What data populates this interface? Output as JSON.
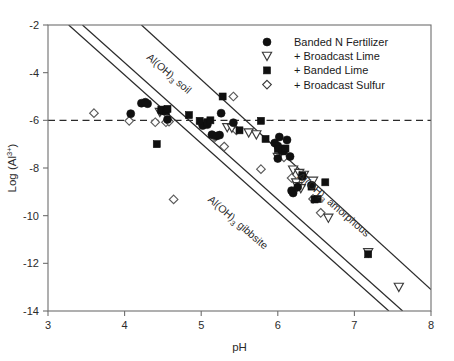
{
  "chart_data": {
    "type": "scatter",
    "title": "",
    "xlabel": "pH",
    "ylabel": "Log (Al3+)",
    "ylabel_base": "Log (Al",
    "ylabel_sup": "3+",
    "ylabel_tail": ")",
    "xlim": [
      3,
      8
    ],
    "ylim": [
      -14,
      -2
    ],
    "xticks": [
      3,
      4,
      5,
      6,
      7,
      8
    ],
    "xtick_labels": [
      "3",
      "4",
      "5",
      "6",
      "7",
      "8"
    ],
    "yticks": [
      -2,
      -4,
      -6,
      -8,
      -10,
      -12,
      -14
    ],
    "ytick_labels": [
      "-2",
      "-4",
      "-6",
      "-8",
      "-10",
      "-12",
      "-14"
    ],
    "grid": false,
    "legend_position": "top-right",
    "legend": [
      {
        "label": "Banded N Fertilizer",
        "marker": "filled-circle"
      },
      {
        "label": "+ Broadcast Lime",
        "marker": "open-triangle-down"
      },
      {
        "label": "+ Banded Lime",
        "marker": "filled-square"
      },
      {
        "label": "+ Broadcast Sulfur",
        "marker": "open-diamond"
      }
    ],
    "reference_line": {
      "label": "",
      "style": "dashed",
      "orientation": "horizontal",
      "y": -6.0
    },
    "annotations": [
      {
        "text": "Al(OH)3 soil",
        "base": "Al(OH)",
        "sub": "3",
        "tail": " soil",
        "x": 4.55,
        "y": -4.15,
        "rotation": 41
      },
      {
        "text": "Al(OH)3 gibbsite",
        "base": "Al(OH)",
        "sub": "3",
        "tail": " gibbsite",
        "x": 5.45,
        "y": -10.4,
        "rotation": 41
      },
      {
        "text": "Al(OH)3 amorphous",
        "base": "Al(OH)",
        "sub": "3",
        "tail": " amorphous",
        "x": 6.7,
        "y": -9.65,
        "rotation": 41
      }
    ],
    "solubility_lines": [
      {
        "name": "Al(OH)3 soil",
        "x1": 3.27,
        "y1": -2.0,
        "x2": 7.45,
        "y2": -14.0
      },
      {
        "name": "Al(OH)3 gibbsite",
        "x1": 3.45,
        "y1": -2.0,
        "x2": 7.63,
        "y2": -14.0
      },
      {
        "name": "Al(OH)3 amorphous",
        "x1": 4.22,
        "y1": -2.0,
        "x2": 8.0,
        "y2": -13.1
      }
    ],
    "series": [
      {
        "name": "Banded N Fertilizer",
        "marker": "filled-circle",
        "color": "#101010",
        "points": [
          [
            4.08,
            -5.72
          ],
          [
            4.22,
            -5.28
          ],
          [
            4.27,
            -5.24
          ],
          [
            4.3,
            -5.3
          ],
          [
            4.48,
            -5.6
          ],
          [
            4.52,
            -5.58
          ],
          [
            4.56,
            -5.96
          ],
          [
            5.02,
            -6.22
          ],
          [
            5.08,
            -6.18
          ],
          [
            5.14,
            -6.6
          ],
          [
            5.2,
            -6.66
          ],
          [
            5.24,
            -6.62
          ],
          [
            5.26,
            -5.7
          ],
          [
            5.42,
            -6.1
          ],
          [
            5.96,
            -6.95
          ],
          [
            6.0,
            -7.08
          ],
          [
            6.04,
            -7.22
          ],
          [
            6.08,
            -7.28
          ],
          [
            6.02,
            -6.7
          ],
          [
            6.12,
            -6.82
          ],
          [
            6.16,
            -7.52
          ],
          [
            6.0,
            -7.6
          ],
          [
            6.18,
            -8.95
          ],
          [
            6.2,
            -9.05
          ],
          [
            6.26,
            -8.8
          ],
          [
            6.32,
            -8.35
          ],
          [
            6.44,
            -8.72
          ]
        ]
      },
      {
        "name": "+ Broadcast Lime",
        "marker": "open-triangle-down",
        "color": "#3a3a3a",
        "points": [
          [
            4.46,
            -5.66
          ],
          [
            5.34,
            -6.3
          ],
          [
            5.4,
            -6.32
          ],
          [
            5.62,
            -6.52
          ],
          [
            5.72,
            -6.6
          ],
          [
            6.0,
            -7.55
          ],
          [
            6.2,
            -8.08
          ],
          [
            6.28,
            -8.22
          ],
          [
            6.34,
            -8.3
          ],
          [
            6.24,
            -8.62
          ],
          [
            6.26,
            -8.78
          ],
          [
            6.3,
            -8.86
          ],
          [
            6.46,
            -8.55
          ],
          [
            6.66,
            -10.1
          ],
          [
            7.18,
            -11.55
          ],
          [
            7.58,
            -13.0
          ]
        ]
      },
      {
        "name": "+ Banded Lime",
        "marker": "filled-square",
        "color": "#101010",
        "points": [
          [
            4.42,
            -7.0
          ],
          [
            4.48,
            -5.55
          ],
          [
            4.54,
            -5.62
          ],
          [
            4.56,
            -5.52
          ],
          [
            4.84,
            -5.78
          ],
          [
            4.98,
            -6.02
          ],
          [
            5.08,
            -6.08
          ],
          [
            5.12,
            -6.0
          ],
          [
            5.28,
            -5.0
          ],
          [
            5.5,
            -6.42
          ],
          [
            5.78,
            -6.02
          ],
          [
            5.84,
            -6.78
          ],
          [
            6.0,
            -7.2
          ],
          [
            6.06,
            -7.3
          ],
          [
            6.1,
            -7.18
          ],
          [
            6.32,
            -8.32
          ],
          [
            6.44,
            -8.78
          ],
          [
            6.48,
            -9.32
          ],
          [
            6.52,
            -9.3
          ],
          [
            6.62,
            -8.6
          ],
          [
            7.18,
            -11.62
          ]
        ]
      },
      {
        "name": "+ Broadcast Sulfur",
        "marker": "open-diamond",
        "color": "#5a5a5a",
        "points": [
          [
            3.6,
            -5.7
          ],
          [
            4.06,
            -6.02
          ],
          [
            4.4,
            -6.08
          ],
          [
            4.52,
            -5.62
          ],
          [
            4.54,
            -6.08
          ],
          [
            4.58,
            -6.05
          ],
          [
            4.64,
            -9.32
          ],
          [
            5.0,
            -6.12
          ],
          [
            5.18,
            -6.7
          ],
          [
            5.3,
            -7.1
          ],
          [
            5.42,
            -5.0
          ],
          [
            5.46,
            -6.42
          ],
          [
            5.78,
            -8.05
          ],
          [
            6.08,
            -7.55
          ],
          [
            6.18,
            -8.42
          ],
          [
            6.46,
            -9.3
          ],
          [
            6.56,
            -9.88
          ]
        ]
      }
    ]
  }
}
